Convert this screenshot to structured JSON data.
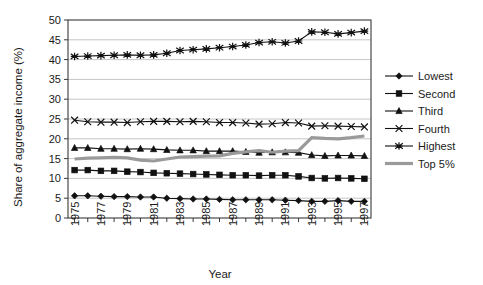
{
  "chart_data": {
    "type": "line",
    "title": "",
    "xlabel": "Year",
    "ylabel": "Share of aggregate income (%)",
    "ylim": [
      0,
      50
    ],
    "ytick_step": 5,
    "yticks": [
      "0",
      "5",
      "10",
      "15",
      "20",
      "25",
      "30",
      "35",
      "40",
      "45",
      "50"
    ],
    "grid": true,
    "grid_axis": "y",
    "legend_position": "right",
    "x": [
      1975,
      1976,
      1977,
      1978,
      1979,
      1980,
      1981,
      1982,
      1983,
      1984,
      1985,
      1986,
      1987,
      1988,
      1989,
      1990,
      1991,
      1992,
      1993,
      1994,
      1995,
      1996,
      1997
    ],
    "xticks_labeled": [
      "1975",
      "1977",
      "1979",
      "1981",
      "1983",
      "1985",
      "1987",
      "1989",
      "1991",
      "1993",
      "1995",
      "1997"
    ],
    "series": [
      {
        "name": "Lowest",
        "marker": "diamond",
        "values": [
          5.6,
          5.6,
          5.5,
          5.4,
          5.4,
          5.3,
          5.3,
          5.0,
          4.9,
          4.8,
          4.8,
          4.7,
          4.6,
          4.6,
          4.6,
          4.6,
          4.5,
          4.4,
          4.2,
          4.2,
          4.4,
          4.2,
          4.2
        ]
      },
      {
        "name": "Second",
        "marker": "square",
        "values": [
          12.1,
          12.1,
          11.9,
          11.9,
          11.7,
          11.6,
          11.4,
          11.3,
          11.2,
          11.1,
          11.0,
          10.9,
          10.8,
          10.8,
          10.7,
          10.8,
          10.8,
          10.5,
          10.1,
          10.0,
          10.1,
          10.0,
          9.9
        ]
      },
      {
        "name": "Third",
        "marker": "triangle",
        "values": [
          17.7,
          17.7,
          17.5,
          17.5,
          17.4,
          17.5,
          17.4,
          17.2,
          17.1,
          17.1,
          16.9,
          16.9,
          16.9,
          16.7,
          16.5,
          16.6,
          16.6,
          16.5,
          15.9,
          15.7,
          15.8,
          15.8,
          15.7
        ]
      },
      {
        "name": "Fourth",
        "marker": "x",
        "values": [
          24.7,
          24.3,
          24.2,
          24.2,
          24.1,
          24.3,
          24.4,
          24.4,
          24.3,
          24.4,
          24.3,
          24.1,
          24.1,
          24.0,
          23.7,
          23.8,
          24.1,
          24.0,
          23.2,
          23.3,
          23.2,
          23.1,
          23.0
        ]
      },
      {
        "name": "Highest",
        "marker": "asterisk",
        "values": [
          40.8,
          40.9,
          41.0,
          41.1,
          41.2,
          41.1,
          41.2,
          41.6,
          42.3,
          42.5,
          42.7,
          43.0,
          43.3,
          43.7,
          44.3,
          44.5,
          44.2,
          44.7,
          47.0,
          46.9,
          46.5,
          46.8,
          47.2
        ]
      },
      {
        "name": "Top 5%",
        "marker": "none",
        "style": "thick-gray",
        "values": [
          14.9,
          15.1,
          15.2,
          15.3,
          15.2,
          14.6,
          14.4,
          14.9,
          15.4,
          15.5,
          15.6,
          15.7,
          16.3,
          16.7,
          17.0,
          16.6,
          16.9,
          17.0,
          20.3,
          20.1,
          20.0,
          20.3,
          20.7
        ]
      }
    ]
  },
  "legend": {
    "items": [
      {
        "label": "Lowest"
      },
      {
        "label": "Second"
      },
      {
        "label": "Third"
      },
      {
        "label": "Fourth"
      },
      {
        "label": "Highest"
      },
      {
        "label": "Top 5%"
      }
    ]
  },
  "colors": {
    "series_line": "#111111",
    "top5_line": "#9a9a9a",
    "grid": "#b8b8b8",
    "frame": "#3a3a3a",
    "text": "#1a1a1a",
    "background": "#ffffff"
  }
}
